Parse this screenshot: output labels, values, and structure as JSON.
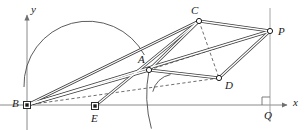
{
  "figure": {
    "type": "geometry-diagram",
    "title": "",
    "background_color": "#ffffff",
    "stroke_color": "#3c3c3c",
    "axis_color": "#7a7a7a",
    "width": 307,
    "height": 130,
    "axes": {
      "x_label": "x",
      "y_label": "y",
      "origin_label": "B",
      "x_axis_y": 105,
      "y_axis_x": 27,
      "x_arrow_tip_x": 289,
      "y_arrow_tip_y": 16
    },
    "points": [
      {
        "id": "B",
        "label": "B",
        "x": 27,
        "y": 105,
        "marker": "square",
        "label_dx": -13,
        "label_dy": -6
      },
      {
        "id": "E",
        "label": "E",
        "x": 95,
        "y": 106,
        "marker": "square",
        "label_dx": -3,
        "label_dy": 8
      },
      {
        "id": "A",
        "label": "A",
        "x": 149,
        "y": 70,
        "marker": "circle",
        "label_dx": -10,
        "label_dy": -14
      },
      {
        "id": "C",
        "label": "C",
        "x": 199,
        "y": 21,
        "marker": "circle",
        "label_dx": -7,
        "label_dy": -14
      },
      {
        "id": "D",
        "label": "D",
        "x": 219,
        "y": 78,
        "marker": "circle",
        "label_dx": 6,
        "label_dy": 4
      },
      {
        "id": "P",
        "label": "P",
        "x": 270,
        "y": 31,
        "marker": "circle",
        "label_dx": 8,
        "label_dy": -3
      },
      {
        "id": "Q",
        "label": "Q",
        "x": 270,
        "y": 105,
        "marker": "none",
        "label_dx": -4,
        "label_dy": 8
      }
    ],
    "double_segments": [
      {
        "from": "B",
        "to": "C",
        "name": "segment-BC"
      },
      {
        "from": "B",
        "to": "A",
        "name": "segment-BA"
      },
      {
        "from": "B",
        "to": "P",
        "name": "segment-BP"
      },
      {
        "from": "A",
        "to": "C",
        "name": "segment-AC"
      },
      {
        "from": "C",
        "to": "P",
        "name": "segment-CP"
      },
      {
        "from": "P",
        "to": "D",
        "name": "segment-PD"
      },
      {
        "from": "D",
        "to": "A",
        "name": "segment-DA"
      },
      {
        "from": "E",
        "to": "C",
        "name": "segment-EC"
      }
    ],
    "dashed_segments": [
      {
        "from": "B",
        "to": "D",
        "name": "segment-BD"
      },
      {
        "from": "C",
        "to": "D",
        "name": "segment-CD"
      },
      {
        "from": "A",
        "to": "P",
        "name": "segment-AP"
      }
    ],
    "thin_segments": [
      {
        "from": "P",
        "to": "Q",
        "name": "segment-PQ"
      }
    ],
    "arcs": [
      {
        "name": "semicircle-on-BA",
        "cx": 88,
        "cy": 87,
        "r": 64,
        "start_deg": 180,
        "end_deg": 332
      },
      {
        "name": "arc-centered-B-through-A",
        "cx": 27,
        "cy": 105,
        "r": 127,
        "start_deg": 344,
        "end_deg": 11
      },
      {
        "name": "angle-arc-at-A",
        "cx": 149,
        "cy": 70,
        "r": 22,
        "start_deg": 12,
        "end_deg": 80
      }
    ],
    "right_angle_marker": {
      "name": "right-angle-at-Q",
      "x": 270,
      "y": 105,
      "size": 8
    }
  }
}
